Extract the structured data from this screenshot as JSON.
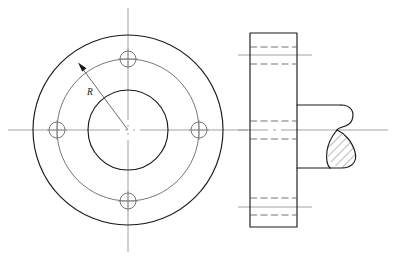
{
  "drawing": {
    "title": "Flange with four bolt holes — front view and sectional side view",
    "labels": {
      "radius": "R"
    },
    "colors": {
      "outline": "#1a1a1a",
      "thin": "#4a4a4a",
      "centerline": "#8a8a8a",
      "hidden": "#5a5a5a",
      "background": "#ffffff"
    },
    "front_view": {
      "name": "front-view",
      "center": {
        "x": 128,
        "y": 130
      },
      "outer_circle_radius": 95,
      "bolt_circle_radius": 71,
      "bore_circle_radius": 40,
      "bolt_hole_radius": 8,
      "bolt_hole_count": 4,
      "bolt_hole_angles_deg": [
        0,
        90,
        180,
        270
      ],
      "vertical_centerline": {
        "x": 128,
        "y1": 8,
        "y2": 252
      },
      "horizontal_centerline": {
        "y": 130,
        "x1": 8,
        "x2": 248
      },
      "radius_leader": {
        "label": "R",
        "from": {
          "x": 128,
          "y": 130
        },
        "to": {
          "x": 79,
          "y": 64
        },
        "label_pos": {
          "x": 90,
          "y": 92
        }
      }
    },
    "section_view": {
      "name": "section-view",
      "plate": {
        "x": 250,
        "y": 33,
        "width": 47,
        "height": 194
      },
      "hub_top_y": 105,
      "hub_bottom_y": 168,
      "hub_right_x": 363,
      "horizontal_centerline": {
        "y": 130,
        "x1": 238,
        "x2": 388
      },
      "top_hole_centerline": {
        "y": 55,
        "x1": 238,
        "x2": 312
      },
      "bottom_hole_centerline": {
        "y": 207,
        "x1": 238,
        "x2": 312
      },
      "hidden_lines": [
        {
          "name": "top-hole-upper",
          "y": 47,
          "x1": 250,
          "x2": 297
        },
        {
          "name": "top-hole-lower",
          "y": 64,
          "x1": 250,
          "x2": 297
        },
        {
          "name": "bore-upper",
          "y": 121,
          "x1": 250,
          "x2": 297
        },
        {
          "name": "bore-lower",
          "y": 139,
          "x1": 250,
          "x2": 297
        },
        {
          "name": "bottom-hole-upper",
          "y": 198,
          "x1": 250,
          "x2": 297
        },
        {
          "name": "bottom-hole-lower",
          "y": 215,
          "x1": 250,
          "x2": 297
        }
      ],
      "hatched_region_name": "hub-section-hatching"
    }
  }
}
